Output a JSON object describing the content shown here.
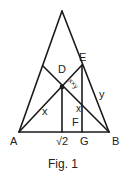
{
  "figure": {
    "caption": "Fig. 1",
    "stroke_color": "#1a1a1a",
    "points": {
      "apex": [
        62,
        11
      ],
      "A": [
        19,
        132
      ],
      "B": [
        109,
        132
      ],
      "E": [
        82,
        65
      ],
      "L": [
        43,
        66
      ],
      "D_intersection": [
        62,
        87
      ],
      "foot_D": [
        62,
        132
      ],
      "G": [
        82,
        132
      ]
    },
    "labels": {
      "A": "A",
      "B": "B",
      "D": "D",
      "E": "E",
      "F": "F",
      "G": "G",
      "y": "y",
      "x_left": "x",
      "x_right": "x",
      "xy_product": "x×y",
      "sqrt2": "√2"
    }
  }
}
